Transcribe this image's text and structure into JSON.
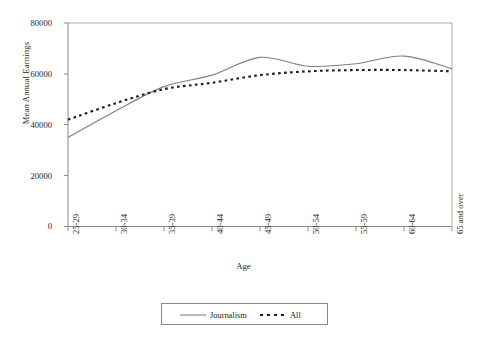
{
  "chart_data": {
    "type": "line",
    "title": "",
    "xlabel": "Age",
    "ylabel": "Mean Annual Earnings",
    "categories": [
      "25-29",
      "30-34",
      "35-39",
      "40-44",
      "45-49",
      "50-54",
      "55-59",
      "60-64",
      "65 and over"
    ],
    "ylim": [
      0,
      80000
    ],
    "yticks": [
      0,
      20000,
      40000,
      60000,
      80000
    ],
    "ytick_labels": [
      "0",
      "20000",
      "40000",
      "60000",
      "80000"
    ],
    "grid": false,
    "legend_position": "bottom",
    "series": [
      {
        "name": "Journalism",
        "style": "solid",
        "color": "#808080",
        "values": [
          35000,
          45500,
          55000,
          59500,
          66500,
          63000,
          64000,
          67000,
          62000
        ]
      },
      {
        "name": "All",
        "style": "dashed",
        "color": "#1a1a1a",
        "values": [
          42000,
          48500,
          54000,
          56500,
          59500,
          61000,
          61500,
          61500,
          61000
        ]
      }
    ]
  },
  "axes": {
    "y_title": "Mean Annual Earnings",
    "x_title": "Age",
    "y_tick_labels": [
      "80000",
      "60000",
      "40000",
      "20000",
      "0"
    ],
    "x_tick_labels": [
      "25-29",
      "30-34",
      "35-39",
      "40-44",
      "45-49",
      "50-54",
      "55-59",
      "60-64",
      "65 and over"
    ]
  },
  "legend": {
    "items": [
      {
        "label": "Journalism",
        "style": "solid",
        "color": "#808080"
      },
      {
        "label": "All",
        "style": "dashed",
        "color": "#1a1a1a"
      }
    ]
  }
}
